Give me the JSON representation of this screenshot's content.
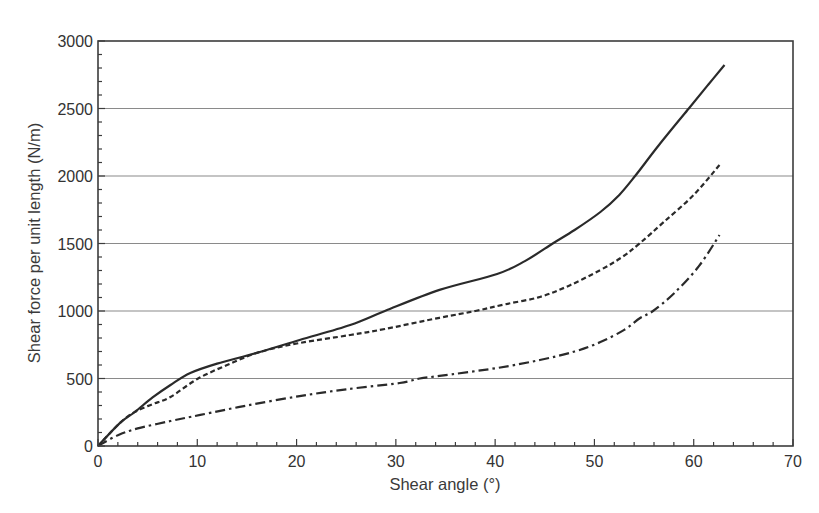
{
  "chart_data": {
    "type": "line",
    "title": "",
    "xlabel": "Shear angle (°)",
    "ylabel": "Shear force per unit length (N/m)",
    "xlim": [
      0,
      70
    ],
    "ylim": [
      0,
      3000
    ],
    "x_ticks": [
      0,
      10,
      20,
      30,
      40,
      50,
      60,
      70
    ],
    "y_ticks": [
      0,
      500,
      1000,
      1500,
      2000,
      2500,
      3000
    ],
    "x_minor_step": 2,
    "y_minor_step": 100,
    "grid": {
      "horizontal": true,
      "vertical": false
    },
    "legend": null,
    "series": [
      {
        "name": "solid",
        "style": "solid",
        "x": [
          0,
          2.2,
          3.7,
          5.5,
          7.3,
          9.3,
          12,
          16.3,
          20.3,
          25.4,
          28.9,
          34.4,
          40.2,
          43,
          45.8,
          48,
          50.6,
          52.5,
          54.1,
          56.5,
          59.5,
          61.5,
          63.1
        ],
        "y": [
          0,
          170,
          252,
          360,
          452,
          541,
          610,
          696,
          785,
          896,
          1000,
          1156,
          1274,
          1370,
          1500,
          1600,
          1733,
          1860,
          2000,
          2230,
          2500,
          2680,
          2822
        ]
      },
      {
        "name": "dashed",
        "style": "dashed",
        "x": [
          0,
          2.2,
          3.7,
          5.5,
          7.3,
          10,
          13,
          16.3,
          20.3,
          25.4,
          28.9,
          34.4,
          38,
          41,
          44.5,
          47.5,
          50.6,
          52.8,
          54.6,
          57,
          60,
          62.6
        ],
        "y": [
          0,
          170,
          252,
          310,
          363,
          496,
          600,
          696,
          763,
          822,
          867,
          950,
          1000,
          1050,
          1104,
          1190,
          1304,
          1400,
          1504,
          1660,
          1860,
          2081
        ]
      },
      {
        "name": "dash-dot",
        "style": "dash-dot",
        "x": [
          0,
          2,
          4,
          7.3,
          10.3,
          15,
          20.3,
          25,
          30.4,
          32.4,
          34.4,
          40.2,
          44.5,
          48,
          50.6,
          53,
          54.6,
          55.9,
          58,
          60.5,
          62.6
        ],
        "y": [
          0,
          80,
          130,
          185,
          230,
          300,
          370,
          420,
          467,
          500,
          519,
          578,
          637,
          700,
          770,
          860,
          948,
          1000,
          1130,
          1330,
          1563
        ]
      }
    ]
  }
}
